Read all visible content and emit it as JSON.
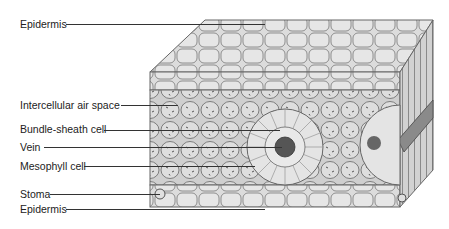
{
  "diagram": {
    "labels": [
      {
        "text": "Epidermis",
        "x": 20,
        "y": 18,
        "line_x1": 66,
        "line_x2": 265,
        "line_y": 24
      },
      {
        "text": "Intercellular air space",
        "x": 20,
        "y": 99,
        "line_x1": 121,
        "line_x2": 178,
        "line_y": 105
      },
      {
        "text": "Bundle-sheath cell",
        "x": 20,
        "y": 123,
        "line_x1": 104,
        "line_x2": 280,
        "line_y": 130
      },
      {
        "text": "Vein",
        "x": 20,
        "y": 141,
        "line_x1": 44,
        "line_x2": 282,
        "line_y": 147
      },
      {
        "text": "Mesophyll cell",
        "x": 20,
        "y": 160,
        "line_x1": 84,
        "line_x2": 255,
        "line_y": 166
      },
      {
        "text": "Stoma",
        "x": 20,
        "y": 188,
        "line_x1": 50,
        "line_x2": 160,
        "line_y": 194
      },
      {
        "text": "Epidermis",
        "x": 20,
        "y": 203,
        "line_x1": 66,
        "line_x2": 265,
        "line_y": 209
      }
    ],
    "colors": {
      "line": "#333333",
      "text": "#222222",
      "cell_fill": "#d8d8d8",
      "cell_stroke": "#6a6a6a"
    }
  }
}
